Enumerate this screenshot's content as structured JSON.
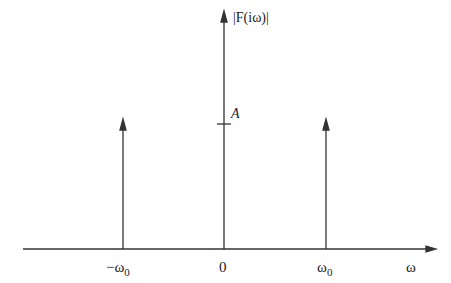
{
  "diagram": {
    "y_axis_label": "|F(iω)|",
    "x_axis_label": "ω",
    "amplitude_label": "A",
    "ticks": [
      {
        "label": "−ω",
        "sub": "0",
        "position": "-omega0"
      },
      {
        "label": "0",
        "sub": "",
        "position": "0"
      },
      {
        "label": "ω",
        "sub": "0",
        "position": "omega0"
      }
    ],
    "impulses": [
      {
        "at": "-omega0",
        "height": "A"
      },
      {
        "at": "0",
        "height": "2A"
      },
      {
        "at": "omega0",
        "height": "A"
      }
    ],
    "colors": {
      "line": "#333333",
      "background": "#ffffff"
    }
  }
}
